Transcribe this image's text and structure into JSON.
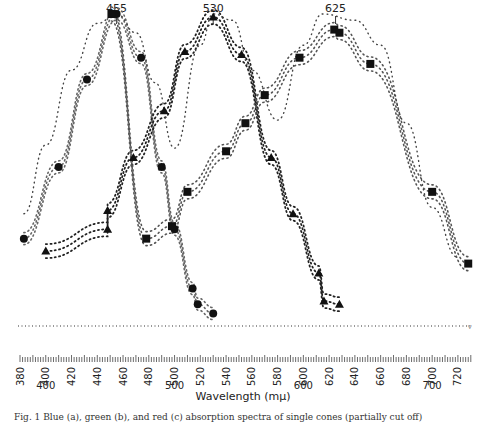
{
  "chart_data": {
    "type": "scatter",
    "title": "",
    "xlabel": "Wavelength (mμ)",
    "ylabel": "",
    "xlim": [
      380,
      730
    ],
    "ylim": [
      0,
      1
    ],
    "grid": false,
    "legend": "none",
    "peak_labels": [
      {
        "label": "455",
        "x": 455
      },
      {
        "label": "530",
        "x": 530
      },
      {
        "label": "625",
        "x": 625
      }
    ],
    "tick_labels_rotated": [
      "380",
      "400",
      "420",
      "440",
      "460",
      "480",
      "500",
      "520",
      "540",
      "560",
      "580",
      "600",
      "620",
      "640",
      "660",
      "680",
      "700",
      "720"
    ],
    "tick_labels_horizontal": [
      "400",
      "500",
      "600",
      "700"
    ],
    "baseline": {
      "style": "dotted",
      "y": 0
    },
    "series": [
      {
        "name": "blue-cone band (455)",
        "marker": "circle",
        "points": [
          [
            383,
            0.28
          ],
          [
            410,
            0.51
          ],
          [
            432,
            0.79
          ],
          [
            455,
            1.0
          ],
          [
            474,
            0.86
          ],
          [
            490,
            0.51
          ],
          [
            500,
            0.31
          ],
          [
            514,
            0.12
          ],
          [
            518,
            0.07
          ],
          [
            530,
            0.04
          ]
        ]
      },
      {
        "name": "green-cone band (530)",
        "marker": "triangle",
        "points": [
          [
            400,
            0.24
          ],
          [
            448,
            0.31
          ],
          [
            448,
            0.37
          ],
          [
            468,
            0.54
          ],
          [
            492,
            0.69
          ],
          [
            508,
            0.88
          ],
          [
            530,
            0.99
          ],
          [
            552,
            0.87
          ],
          [
            575,
            0.54
          ],
          [
            592,
            0.36
          ],
          [
            612,
            0.17
          ],
          [
            616,
            0.08
          ],
          [
            628,
            0.07
          ]
        ]
      },
      {
        "name": "red-cone band (625)",
        "marker": "square",
        "points": [
          [
            451,
            1.0
          ],
          [
            478,
            0.28
          ],
          [
            498,
            0.32
          ],
          [
            510,
            0.43
          ],
          [
            540,
            0.56
          ],
          [
            555,
            0.65
          ],
          [
            570,
            0.74
          ],
          [
            597,
            0.86
          ],
          [
            624,
            0.95
          ],
          [
            628,
            0.94
          ],
          [
            652,
            0.84
          ],
          [
            700,
            0.43
          ],
          [
            728,
            0.2
          ]
        ]
      },
      {
        "name": "envelope upper (+)",
        "marker": "plus",
        "points": [
          [
            383,
            0.36
          ],
          [
            400,
            0.58
          ],
          [
            420,
            0.82
          ],
          [
            440,
            0.97
          ],
          [
            455,
            1.0
          ],
          [
            470,
            0.94
          ],
          [
            485,
            0.78
          ],
          [
            500,
            0.57
          ],
          [
            520,
            0.9
          ],
          [
            530,
            1.0
          ],
          [
            545,
            0.98
          ],
          [
            560,
            0.82
          ],
          [
            580,
            0.66
          ],
          [
            600,
            0.9
          ],
          [
            615,
            1.0
          ],
          [
            640,
            0.98
          ],
          [
            660,
            0.9
          ],
          [
            680,
            0.65
          ],
          [
            700,
            0.38
          ],
          [
            720,
            0.22
          ]
        ]
      }
    ]
  },
  "caption": "Fig. 1  Blue (a), green (b), and red (c) absorption spectra of single cones (partially cut off)"
}
